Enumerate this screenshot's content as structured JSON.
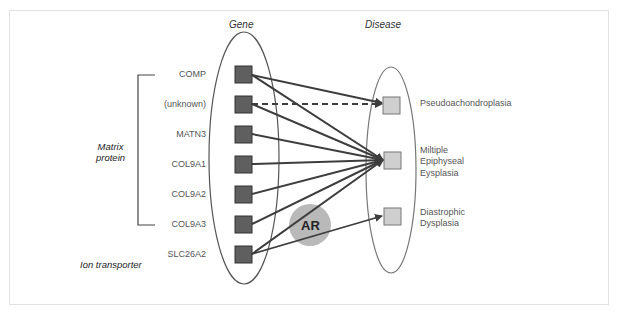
{
  "headers": {
    "gene": "Gene",
    "disease": "Disease"
  },
  "groups": {
    "matrix_protein": [
      "Matrix",
      "protein"
    ],
    "ion_transporter": "Ion transporter"
  },
  "genes": [
    "COMP",
    "(unknown)",
    "MATN3",
    "COL9A1",
    "COL9A2",
    "COL9A3",
    "SLC26A2"
  ],
  "diseases": [
    {
      "lines": [
        "Pseudoachondroplasia"
      ]
    },
    {
      "lines": [
        "Miltiple",
        "Epiphyseal",
        "Eysplasia"
      ]
    },
    {
      "lines": [
        "Diastrophic",
        "Dysplasia"
      ]
    }
  ],
  "badge": "AR",
  "edges": [
    {
      "from": "COMP",
      "to": "Pseudoachondroplasia",
      "style": "solid"
    },
    {
      "from": "COMP",
      "to": "Multiple Epiphyseal Dysplasia",
      "style": "solid"
    },
    {
      "from": "(unknown)",
      "to": "Pseudoachondroplasia",
      "style": "dashed"
    },
    {
      "from": "(unknown)",
      "to": "Multiple Epiphyseal Dysplasia",
      "style": "solid"
    },
    {
      "from": "MATN3",
      "to": "Multiple Epiphyseal Dysplasia",
      "style": "solid"
    },
    {
      "from": "COL9A1",
      "to": "Multiple Epiphyseal Dysplasia",
      "style": "solid"
    },
    {
      "from": "COL9A2",
      "to": "Multiple Epiphyseal Dysplasia",
      "style": "solid"
    },
    {
      "from": "COL9A3",
      "to": "Multiple Epiphyseal Dysplasia",
      "style": "solid"
    },
    {
      "from": "SLC26A2",
      "to": "Multiple Epiphyseal Dysplasia",
      "style": "solid"
    },
    {
      "from": "SLC26A2",
      "to": "Diastrophic Dysplasia",
      "style": "solid"
    }
  ],
  "colors": {
    "gene_box": "#5f5f5f",
    "disease_box": "#cfcfcf",
    "badge": "#b9b9b9",
    "line": "#3d3d3d"
  }
}
